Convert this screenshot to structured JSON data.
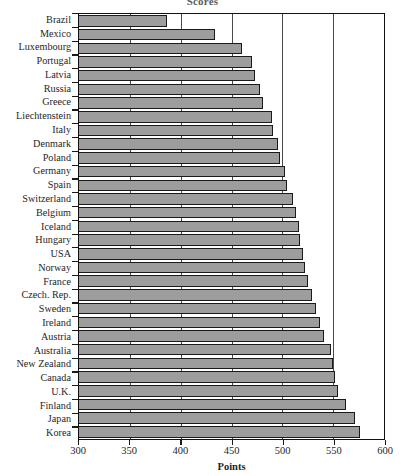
{
  "chart_data": {
    "type": "bar",
    "orientation": "horizontal",
    "title": "Scores",
    "xlabel": "Points",
    "ylabel": "",
    "xlim": [
      300,
      600
    ],
    "xticks": [
      300,
      350,
      400,
      450,
      500,
      550,
      600
    ],
    "xtick_labels": [
      "300",
      "350",
      "400",
      "450",
      "500",
      "550",
      "600"
    ],
    "grid": true,
    "grid_axis": "x",
    "legend": null,
    "bar_fill_color": "#9d9d9d",
    "bar_edge_color": "#1a1a1a",
    "categories": [
      "Brazil",
      "Mexico",
      "Luxembourg",
      "Portugal",
      "Latvia",
      "Russia",
      "Greece",
      "Liechtenstein",
      "Italy",
      "Denmark",
      "Poland",
      "Germany",
      "Spain",
      "Switzerland",
      "Belgium",
      "Iceland",
      "Hungary",
      "USA",
      "Norway",
      "France",
      "Czech. Rep.",
      "Sweden",
      "Ireland",
      "Austria",
      "Australia",
      "New Zealand",
      "Canada",
      "U.K.",
      "Finland",
      "Japan",
      "Korea"
    ],
    "values": [
      387,
      434,
      460,
      470,
      473,
      478,
      481,
      490,
      491,
      496,
      498,
      503,
      505,
      510,
      513,
      516,
      517,
      520,
      522,
      525,
      529,
      533,
      537,
      541,
      548,
      550,
      552,
      555,
      563,
      571,
      576
    ]
  }
}
